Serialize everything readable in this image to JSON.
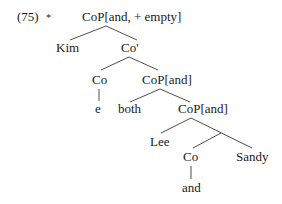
{
  "example": {
    "number": "(75)",
    "judgment": "*"
  },
  "tree": {
    "root": "CoP[and, + empty]",
    "nodes": {
      "kim": "Kim",
      "co_bar": "Co'",
      "co_1": "Co",
      "cop_and_1": "CoP[and]",
      "e": "e",
      "both": "both",
      "cop_and_2": "CoP[and]",
      "lee": "Lee",
      "co_2": "Co",
      "sandy": "Sandy",
      "and": "and"
    },
    "structure": {
      "label": "CoP[and, + empty]",
      "children": [
        {
          "label": "Kim"
        },
        {
          "label": "Co'",
          "children": [
            {
              "label": "Co",
              "children": [
                {
                  "label": "e"
                }
              ]
            },
            {
              "label": "CoP[and]",
              "children": [
                {
                  "label": "both"
                },
                {
                  "label": "CoP[and]",
                  "children": [
                    {
                      "label": "Lee"
                    },
                    {
                      "label": "",
                      "children": [
                        {
                          "label": "Co",
                          "children": [
                            {
                              "label": "and"
                            }
                          ]
                        },
                        {
                          "label": "Sandy"
                        }
                      ]
                    }
                  ]
                }
              ]
            }
          ]
        }
      ]
    }
  },
  "colors": {
    "text": "#1a1a1a",
    "lines": "#3a3a3a",
    "background": "#ffffff"
  }
}
